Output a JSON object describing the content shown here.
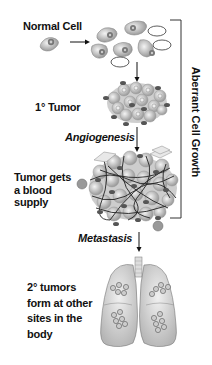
{
  "diagram": {
    "stages": [
      {
        "id": "normal",
        "label": "Normal Cell"
      },
      {
        "id": "primary",
        "label": "1° Tumor"
      },
      {
        "id": "blood",
        "label": "Tumor gets a blood supply",
        "lines": [
          "Tumor gets",
          "a blood",
          "supply"
        ]
      },
      {
        "id": "secondary",
        "label": "2° tumors form at other sites in the body",
        "lines": [
          "2° tumors",
          "form at other",
          "sites in the",
          "body"
        ]
      }
    ],
    "transitions": [
      {
        "label": "Angiogenesis"
      },
      {
        "label": "Metastasis"
      }
    ],
    "bracket_label": "Aberrant Cell Growth"
  }
}
